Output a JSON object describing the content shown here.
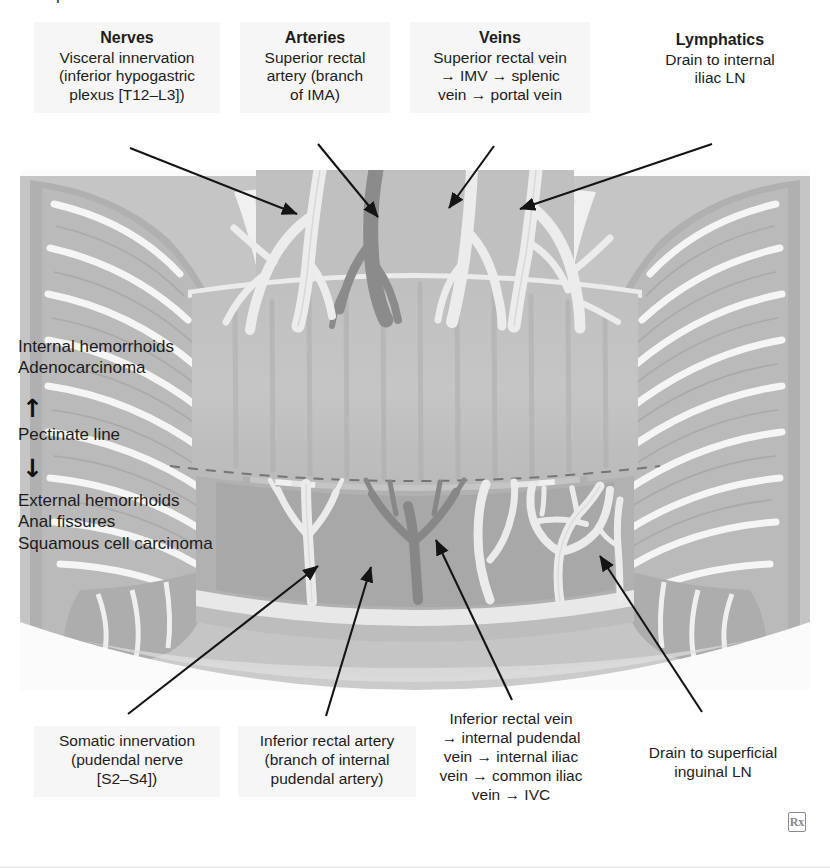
{
  "figure": {
    "title_clipped": "l",
    "watermark": "Rx"
  },
  "top_labels": [
    {
      "id": "nerves",
      "heading": "Nerves",
      "lines": [
        "Visceral innervation",
        "(inferior hypogastric",
        "plexus [T12–L3])"
      ]
    },
    {
      "id": "arteries",
      "heading": "Arteries",
      "lines": [
        "Superior rectal",
        "artery (branch",
        "of IMA)"
      ]
    },
    {
      "id": "veins",
      "heading": "Veins",
      "lines": [
        "Superior rectal vein",
        "→ IMV  → splenic",
        "vein → portal vein"
      ]
    },
    {
      "id": "lymphatics",
      "heading": "Lymphatics",
      "lines": [
        "Drain to internal",
        "iliac LN"
      ]
    }
  ],
  "bottom_labels": [
    {
      "id": "somatic",
      "lines": [
        "Somatic innervation",
        "(pudendal nerve",
        "[S2–S4])"
      ]
    },
    {
      "id": "inferior-rectal-artery",
      "lines": [
        "Inferior rectal artery",
        "(branch of internal",
        "pudendal artery)"
      ]
    },
    {
      "id": "inferior-rectal-vein",
      "lines": [
        "Inferior rectal vein",
        "→ internal pudendal",
        "vein → internal iliac",
        "vein → common iliac",
        "vein → IVC"
      ]
    },
    {
      "id": "superficial-inguinal",
      "lines": [
        "Drain to superficial",
        "inguinal LN"
      ]
    }
  ],
  "side_annotations": {
    "above_pectinate": [
      "Internal hemorrhoids",
      "Adenocarcinoma"
    ],
    "pectinate_line": "Pectinate line",
    "below_pectinate": [
      "External hemorrhoids",
      "Anal fissures",
      "Squamous cell carcinoma"
    ],
    "arrow_up": "↑",
    "arrow_down": "↓"
  },
  "colors": {
    "background": "#ffffff",
    "label_box": "#f6f6f6",
    "text": "#1d1d1b",
    "leader_line": "#1a1a1a",
    "tissue_light": "#e9e9e9",
    "tissue_mid": "#c9c9c9",
    "tissue_dark": "#a8a8a8",
    "tissue_darker": "#8f8f8f",
    "vessel_pale": "#efefef",
    "vessel_dark": "#909090",
    "lumen": "#bdbdbd",
    "pectinate_dash": "#6f6f6f"
  }
}
